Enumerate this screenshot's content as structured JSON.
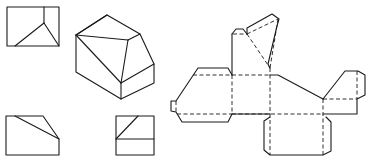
{
  "figure": {
    "type": "technical drawing: orthographic views, isometric view and surface development (net) of a truncated block",
    "colors": {
      "background": "#ffffff",
      "line": "#1a1a1a"
    },
    "views": [
      {
        "name": "top-view",
        "description": "rectangle with vertical line and two diagonals meeting at an interior point"
      },
      {
        "name": "isometric-view",
        "description": "block with sloped triangular cut on top-front corner"
      },
      {
        "name": "front-view",
        "description": "rectangle with slanted top-right corner and diagonal line"
      },
      {
        "name": "side-view",
        "description": "square with horizontal line and a diagonal in upper part"
      },
      {
        "name": "net",
        "description": "unfolded development; solid lines are cut edges, dashed lines are fold lines"
      }
    ],
    "line_styles": {
      "solid": "cut/outline edge",
      "dashed": "fold line"
    }
  }
}
